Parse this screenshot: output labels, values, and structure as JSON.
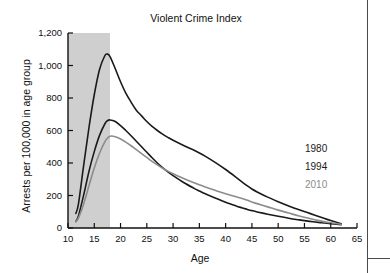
{
  "chart_data": {
    "type": "line",
    "title": "Violent Crime Index",
    "xlabel": "Age",
    "ylabel": "Arrests per 100,000 in age group",
    "xlim": [
      10,
      65
    ],
    "ylim": [
      0,
      1200
    ],
    "xticks": [
      "10",
      "15",
      "20",
      "25",
      "30",
      "35",
      "40",
      "45",
      "50",
      "55",
      "60",
      "65"
    ],
    "yticks": [
      "0",
      "200",
      "400",
      "600",
      "800",
      "1,000",
      "1,200"
    ],
    "grid": false,
    "legend_position": "right-inside",
    "shaded_region": {
      "name": "juvenile-age-band",
      "x_start": 10,
      "x_end": 18,
      "color": "#cfcfcf"
    },
    "x": [
      11.5,
      12,
      13,
      14,
      15,
      16,
      17,
      17.5,
      18,
      19,
      20,
      21,
      22,
      23,
      24,
      25,
      26,
      27,
      28,
      29,
      30,
      32,
      34,
      35,
      36,
      38,
      40,
      42,
      44,
      45,
      46,
      48,
      50,
      52,
      54,
      56,
      58,
      60,
      62
    ],
    "series": [
      {
        "name": "1980",
        "color": "#1a1a1a",
        "width": 1.6,
        "values": [
          90,
          150,
          390,
          620,
          820,
          975,
          1060,
          1070,
          1055,
          980,
          900,
          830,
          775,
          725,
          690,
          655,
          625,
          600,
          578,
          558,
          540,
          508,
          478,
          462,
          444,
          404,
          360,
          312,
          262,
          240,
          222,
          190,
          162,
          136,
          112,
          90,
          68,
          46,
          26
        ]
      },
      {
        "name": "1994",
        "color": "#1a1a1a",
        "width": 1.6,
        "values": [
          40,
          75,
          205,
          350,
          470,
          570,
          640,
          660,
          665,
          655,
          630,
          600,
          568,
          534,
          500,
          466,
          432,
          400,
          372,
          346,
          322,
          280,
          244,
          228,
          212,
          184,
          158,
          136,
          116,
          107,
          99,
          85,
          72,
          60,
          50,
          41,
          33,
          26,
          21
        ]
      },
      {
        "name": "2010",
        "color": "#8c8c8c",
        "width": 1.6,
        "values": [
          38,
          62,
          150,
          262,
          370,
          460,
          530,
          552,
          565,
          562,
          548,
          528,
          506,
          482,
          458,
          434,
          410,
          388,
          368,
          350,
          334,
          304,
          278,
          266,
          254,
          232,
          211,
          192,
          172,
          160,
          150,
          130,
          110,
          92,
          74,
          58,
          44,
          32,
          23
        ]
      }
    ]
  },
  "legend": {
    "items": [
      {
        "label": "1980",
        "color": "#1a1a1a"
      },
      {
        "label": "1994",
        "color": "#1a1a1a"
      },
      {
        "label": "2010",
        "color": "#8c8c8c"
      }
    ]
  }
}
